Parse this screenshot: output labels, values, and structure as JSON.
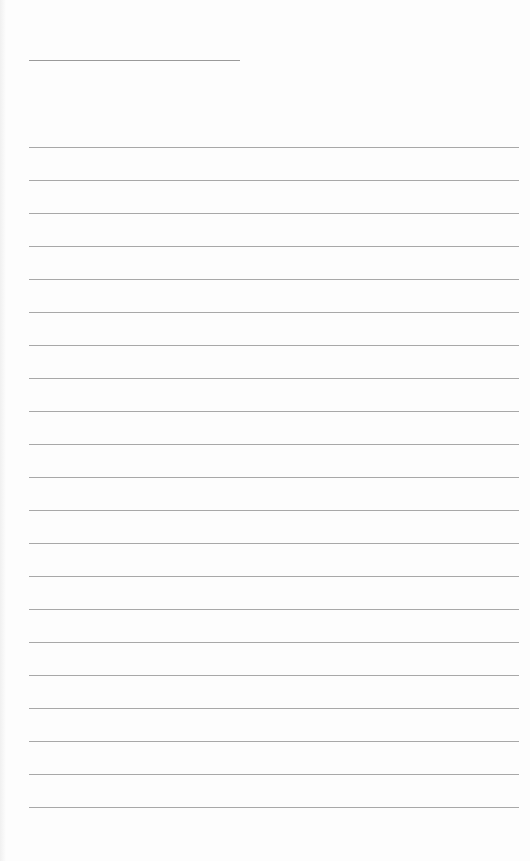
{
  "sheet": {
    "type": "lined-paper",
    "header_line": {
      "x": 29,
      "y": 60,
      "width": 211,
      "color": "#9a9a9a"
    },
    "rules": {
      "count": 21,
      "start_y": 147,
      "spacing": 33,
      "x": 29,
      "width": 490,
      "color": "#a8a8a8"
    },
    "background": "#fdfdfd"
  }
}
